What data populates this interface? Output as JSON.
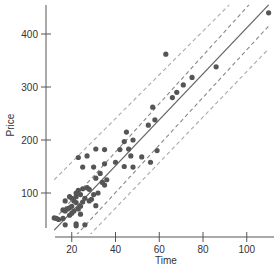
{
  "chart_data": {
    "type": "scatter",
    "title": "",
    "xlabel": "Time",
    "ylabel": "Price",
    "xlim": [
      8,
      110
    ],
    "ylim": [
      20,
      460
    ],
    "xticks": [
      20,
      40,
      60,
      80,
      100
    ],
    "yticks": [
      100,
      200,
      300,
      400
    ],
    "grid": false,
    "legend": null,
    "colors": {
      "points": "#555555",
      "fit_line": "#666666",
      "confidence_band": "#888888",
      "prediction_band": "#aaaaaa",
      "axis": "#555555"
    },
    "series": [
      {
        "name": "observations",
        "points": [
          [
            110,
            440
          ],
          [
            63,
            362
          ],
          [
            86,
            338
          ],
          [
            75,
            318
          ],
          [
            71,
            304
          ],
          [
            66,
            280
          ],
          [
            68,
            290
          ],
          [
            57,
            262
          ],
          [
            58,
            238
          ],
          [
            55,
            228
          ],
          [
            45,
            215
          ],
          [
            48,
            200
          ],
          [
            44,
            197
          ],
          [
            46,
            183
          ],
          [
            47,
            170
          ],
          [
            56,
            158
          ],
          [
            59,
            180
          ],
          [
            52,
            168
          ],
          [
            42,
            182
          ],
          [
            40,
            158
          ],
          [
            35,
            182
          ],
          [
            31,
            183
          ],
          [
            35,
            155
          ],
          [
            27,
            170
          ],
          [
            23,
            167
          ],
          [
            25,
            149
          ],
          [
            30,
            149
          ],
          [
            33,
            137
          ],
          [
            31,
            128
          ],
          [
            34,
            120
          ],
          [
            35,
            115
          ],
          [
            32,
            100
          ],
          [
            30,
            97
          ],
          [
            27,
            110
          ],
          [
            28,
            107
          ],
          [
            25,
            108
          ],
          [
            23,
            105
          ],
          [
            22,
            100
          ],
          [
            24,
            97
          ],
          [
            22,
            93
          ],
          [
            20,
            90
          ],
          [
            19,
            93
          ],
          [
            17,
            85
          ],
          [
            21,
            85
          ],
          [
            22,
            82
          ],
          [
            25,
            83
          ],
          [
            26,
            90
          ],
          [
            28,
            85
          ],
          [
            20,
            75
          ],
          [
            19,
            72
          ],
          [
            18,
            70
          ],
          [
            17,
            66
          ],
          [
            16,
            68
          ],
          [
            21,
            66
          ],
          [
            23,
            70
          ],
          [
            24,
            60
          ],
          [
            20,
            62
          ],
          [
            19,
            58
          ],
          [
            16,
            52
          ],
          [
            14,
            50
          ],
          [
            13,
            52
          ],
          [
            12,
            53
          ],
          [
            17,
            40
          ],
          [
            22,
            42
          ],
          [
            22,
            38
          ],
          [
            26,
            40
          ],
          [
            24,
            75
          ],
          [
            31,
            76
          ],
          [
            29,
            88
          ],
          [
            36,
            125
          ],
          [
            44,
            150
          ],
          [
            48,
            149
          ]
        ]
      }
    ],
    "lines": [
      {
        "name": "fit",
        "style": "solid",
        "from": [
          12,
          30
        ],
        "to": [
          110,
          455
        ]
      },
      {
        "name": "confidence-upper",
        "style": "dashed",
        "from": [
          12,
          50
        ],
        "to": [
          101,
          455
        ]
      },
      {
        "name": "confidence-lower",
        "style": "dashed",
        "from": [
          22,
          20
        ],
        "to": [
          110,
          415
        ]
      },
      {
        "name": "prediction-upper",
        "style": "dashed",
        "from": [
          12,
          125
        ],
        "to": [
          92,
          455
        ]
      },
      {
        "name": "prediction-lower",
        "style": "dashed",
        "from": [
          28,
          20
        ],
        "to": [
          110,
          372
        ]
      }
    ]
  }
}
